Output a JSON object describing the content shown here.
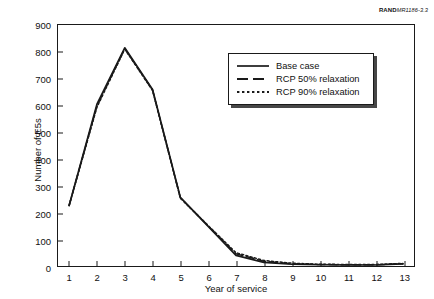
{
  "figure": {
    "rand_id_bold": "RAND",
    "rand_id_rest": "MR1186-3.3"
  },
  "chart_data": {
    "type": "line",
    "title": "",
    "xlabel": "Year of service",
    "ylabel": "Number of E5s",
    "x": [
      1,
      2,
      3,
      4,
      5,
      6,
      7,
      8,
      9,
      10,
      11,
      12,
      13
    ],
    "xlim": [
      0.6,
      13.4
    ],
    "ylim": [
      0,
      900
    ],
    "xticks": [
      1,
      2,
      3,
      4,
      5,
      6,
      7,
      8,
      9,
      10,
      11,
      12,
      13
    ],
    "yticks": [
      0,
      100,
      200,
      300,
      400,
      500,
      600,
      700,
      800,
      900
    ],
    "grid": false,
    "legend_position": "upper right",
    "series": [
      {
        "name": "Base case",
        "style": "solid",
        "values": [
          228,
          605,
          815,
          660,
          258,
          150,
          42,
          16,
          9,
          7,
          6,
          6,
          10
        ]
      },
      {
        "name": "RCP 50% relaxation",
        "style": "dashed",
        "values": [
          228,
          598,
          812,
          658,
          256,
          152,
          48,
          20,
          11,
          8,
          7,
          7,
          11
        ]
      },
      {
        "name": "RCP 90% relaxation",
        "style": "dotted",
        "values": [
          228,
          594,
          810,
          656,
          255,
          153,
          52,
          23,
          13,
          9,
          8,
          8,
          12
        ]
      }
    ]
  }
}
